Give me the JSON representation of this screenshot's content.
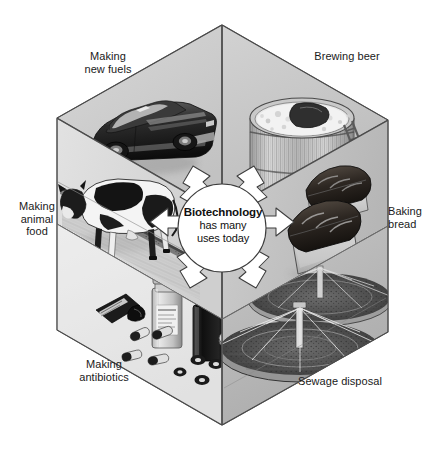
{
  "figure": {
    "title": "Biotechnology has many uses today",
    "shape": "isometric-hexagon-cube",
    "center": {
      "heading": "Biotechnology",
      "line2": "has many",
      "line3": "uses today"
    },
    "panels": [
      {
        "id": "new-fuels",
        "label": "Making\nnew fuels",
        "position": "top-left",
        "illustration": "sports-car",
        "illustration_description": "dark sports car"
      },
      {
        "id": "brewing-beer",
        "label": "Brewing beer",
        "position": "top-right",
        "illustration": "brewing-vat",
        "illustration_description": "wooden fermentation vat with foam and ladder"
      },
      {
        "id": "animal-food",
        "label": "Making\nanimal\nfood",
        "position": "left",
        "illustration": "dairy-cow",
        "illustration_description": "black and white dairy cow in barn"
      },
      {
        "id": "baking-bread",
        "label": "Baking\nbread",
        "position": "right",
        "illustration": "bread-loaves",
        "illustration_description": "two loaves of bread in baking tins"
      },
      {
        "id": "antibiotics",
        "label": "Making\nantibiotics",
        "position": "bottom-left",
        "illustration": "pill-bottles",
        "illustration_description": "medicine bottles with capsules and tablets"
      },
      {
        "id": "sewage-disposal",
        "label": "Sewage disposal",
        "position": "bottom-right",
        "illustration": "sewage-tanks",
        "illustration_description": "circular sewage treatment filter beds"
      }
    ],
    "arrows": {
      "count": 6,
      "style": "white-outlined",
      "direction": "radiating-outward-from-center"
    },
    "colors": {
      "face_top_left": "#cfcfcf",
      "face_top_right": "#c4c4c4",
      "face_left": "#dcdcdc",
      "face_right": "#c9c9c9",
      "face_bottom_left": "#e4e4e4",
      "face_bottom_right": "#bdbdbd",
      "outline": "#4a4a4a",
      "text": "#1a1a1a",
      "background": "#ffffff"
    }
  }
}
